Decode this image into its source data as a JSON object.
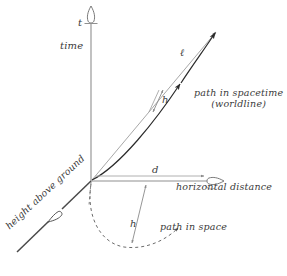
{
  "figure": {
    "kind": "spacetime-diagram",
    "background_color": "#ffffff",
    "axes": {
      "time": {
        "symbol": "t",
        "name": "time",
        "direction": "vertical-up",
        "color": "#8a8a8a",
        "arrowhead": "hollow"
      },
      "horizontal_distance": {
        "symbol": "d",
        "name": "horizontal distance",
        "direction": "horizontal-right",
        "color": "#8a8a8a",
        "arrowhead": "hollow"
      },
      "height_above_ground": {
        "symbol": "h",
        "name": "height above ground",
        "direction": "diagonal-down-left",
        "color": "#4a4a4a",
        "arrowhead": "hollow"
      }
    },
    "curves": [
      {
        "id": "worldline",
        "label": "path in spacetime",
        "sublabel": "(worldline)",
        "style": "solid-curved",
        "color": "#2b2b2b",
        "arrowheads": 2
      },
      {
        "id": "straight-interval",
        "label": "ℓ",
        "style": "solid-straight",
        "color": "#9a9a9a",
        "arrowheads": 1
      },
      {
        "id": "path-in-space",
        "label": "path in space",
        "style": "dashed-arc",
        "color": "#4a4a4a",
        "arrowheads": 1
      }
    ],
    "measures": [
      {
        "id": "h-upper",
        "symbol": "h",
        "style": "double-arrow",
        "color": "#8a8a8a"
      },
      {
        "id": "h-lower",
        "symbol": "h",
        "style": "double-arrow",
        "color": "#8a8a8a"
      },
      {
        "id": "d-span",
        "symbol": "d",
        "style": "arrow",
        "color": "#9a9a9a"
      }
    ]
  },
  "labels": {
    "t": "t",
    "time": "time",
    "ell": "ℓ",
    "h_upper": "h",
    "path_in_spacetime": "path in spacetime",
    "worldline": "(worldline)",
    "d": "d",
    "horizontal_distance": "horizontal distance",
    "h_lower": "h",
    "path_in_space": "path in space",
    "height_above_ground": "height above ground"
  }
}
